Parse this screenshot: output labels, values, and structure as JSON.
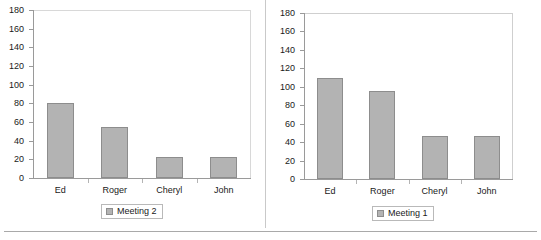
{
  "chart_data": [
    {
      "type": "bar",
      "panel": "left",
      "title": "",
      "categories": [
        "Ed",
        "Roger",
        "Cheryl",
        "John"
      ],
      "values": [
        80,
        55,
        23,
        22
      ],
      "series": [
        {
          "name": "Meeting 2",
          "values": [
            80,
            55,
            23,
            22
          ]
        }
      ],
      "legend": "Meeting 2",
      "legend_position": "bottom",
      "xlabel": "",
      "ylabel": "",
      "ylim": [
        0,
        180
      ],
      "yticks": [
        0,
        20,
        40,
        60,
        80,
        100,
        120,
        140,
        160,
        180
      ],
      "ytick_labels": [
        "0",
        "20",
        "40",
        "60",
        "80",
        "100",
        "120",
        "140",
        "160",
        "180"
      ],
      "grid": false,
      "bar_color": "#b3b3b3",
      "bar_border_color": "#8d8d8d"
    },
    {
      "type": "bar",
      "panel": "right",
      "title": "",
      "categories": [
        "Ed",
        "Roger",
        "Cheryl",
        "John"
      ],
      "values": [
        110,
        95,
        47,
        47
      ],
      "series": [
        {
          "name": "Meeting 1",
          "values": [
            110,
            95,
            47,
            47
          ]
        }
      ],
      "legend": "Meeting 1",
      "legend_position": "bottom",
      "xlabel": "",
      "ylabel": "",
      "ylim": [
        0,
        180
      ],
      "yticks": [
        0,
        20,
        40,
        60,
        80,
        100,
        120,
        140,
        160,
        180
      ],
      "ytick_labels": [
        "0",
        "20",
        "40",
        "60",
        "80",
        "100",
        "120",
        "140",
        "160",
        "180"
      ],
      "grid": false,
      "bar_color": "#b3b3b3",
      "bar_border_color": "#8d8d8d"
    }
  ]
}
